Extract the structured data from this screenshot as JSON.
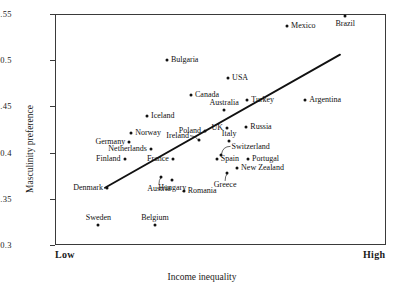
{
  "chart_data": {
    "type": "scatter",
    "title": "",
    "xlabel": "Income inequality",
    "ylabel": "Masculinity preference",
    "x_axis": {
      "type": "ordinal-range",
      "low_label": "Low",
      "high_label": "High",
      "grid": false
    },
    "y_axis": {
      "ticks": [
        "0.55",
        "0.5",
        "0.45",
        "0.4",
        "0.35",
        "0.3"
      ],
      "tick_values": [
        0.55,
        0.5,
        0.45,
        0.4,
        0.35,
        0.3
      ],
      "ylim": [
        0.3,
        0.55
      ],
      "grid": false
    },
    "legend": null,
    "trendline": {
      "present": true,
      "x_start_frac": 0.151,
      "y_start": 0.362,
      "x_end_frac": 0.861,
      "y_end": 0.506
    },
    "points": [
      {
        "name": "Brazil",
        "x_frac": 0.877,
        "y": 0.548,
        "label_pos": "below"
      },
      {
        "name": "Mexico",
        "x_frac": 0.701,
        "y": 0.537,
        "label_pos": "right"
      },
      {
        "name": "Bulgaria",
        "x_frac": 0.338,
        "y": 0.5,
        "label_pos": "right"
      },
      {
        "name": "USA",
        "x_frac": 0.523,
        "y": 0.481,
        "label_pos": "right"
      },
      {
        "name": "Canada",
        "x_frac": 0.411,
        "y": 0.462,
        "label_pos": "right"
      },
      {
        "name": "Argentina",
        "x_frac": 0.756,
        "y": 0.457,
        "label_pos": "right"
      },
      {
        "name": "Australia",
        "x_frac": 0.511,
        "y": 0.446,
        "label_pos": "above"
      },
      {
        "name": "Turkey",
        "x_frac": 0.581,
        "y": 0.457,
        "label_pos": "right"
      },
      {
        "name": "Iceland",
        "x_frac": 0.278,
        "y": 0.44,
        "label_pos": "right"
      },
      {
        "name": "Russia",
        "x_frac": 0.578,
        "y": 0.428,
        "label_pos": "right"
      },
      {
        "name": "UK",
        "x_frac": 0.52,
        "y": 0.427,
        "label_pos": "left"
      },
      {
        "name": "Poland",
        "x_frac": 0.453,
        "y": 0.423,
        "label_pos": "left"
      },
      {
        "name": "Norway",
        "x_frac": 0.23,
        "y": 0.421,
        "label_pos": "right"
      },
      {
        "name": "Ireland",
        "x_frac": 0.435,
        "y": 0.414,
        "label_pos": "leader-left"
      },
      {
        "name": "Italy",
        "x_frac": 0.526,
        "y": 0.413,
        "label_pos": "above"
      },
      {
        "name": "Germany",
        "x_frac": 0.224,
        "y": 0.412,
        "label_pos": "left"
      },
      {
        "name": "Netherlands",
        "x_frac": 0.29,
        "y": 0.404,
        "label_pos": "left"
      },
      {
        "name": "Switzerland",
        "x_frac": 0.5,
        "y": 0.397,
        "label_pos": "leader-right"
      },
      {
        "name": "Finland",
        "x_frac": 0.21,
        "y": 0.393,
        "label_pos": "left"
      },
      {
        "name": "France",
        "x_frac": 0.356,
        "y": 0.393,
        "label_pos": "left"
      },
      {
        "name": "Spain",
        "x_frac": 0.489,
        "y": 0.393,
        "label_pos": "right"
      },
      {
        "name": "Portugal",
        "x_frac": 0.583,
        "y": 0.393,
        "label_pos": "right"
      },
      {
        "name": "New Zealand",
        "x_frac": 0.55,
        "y": 0.383,
        "label_pos": "right"
      },
      {
        "name": "Denmark",
        "x_frac": 0.157,
        "y": 0.362,
        "label_pos": "left"
      },
      {
        "name": "Austria",
        "x_frac": 0.32,
        "y": 0.374,
        "label_pos": "leader-below"
      },
      {
        "name": "Hungary",
        "x_frac": 0.354,
        "y": 0.37,
        "label_pos": "below"
      },
      {
        "name": "Greece",
        "x_frac": 0.52,
        "y": 0.378,
        "label_pos": "leader-below"
      },
      {
        "name": "Romania",
        "x_frac": 0.389,
        "y": 0.358,
        "label_pos": "right"
      },
      {
        "name": "Sweden",
        "x_frac": 0.131,
        "y": 0.322,
        "label_pos": "above"
      },
      {
        "name": "Belgium",
        "x_frac": 0.302,
        "y": 0.322,
        "label_pos": "above"
      }
    ]
  }
}
